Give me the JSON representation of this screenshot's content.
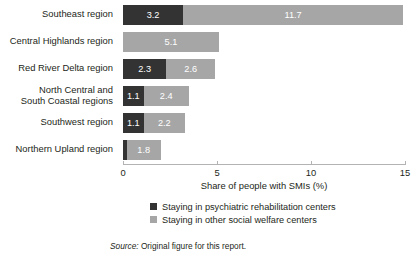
{
  "chart_data": {
    "type": "bar",
    "orientation": "horizontal",
    "stacked": true,
    "title": "",
    "xlabel": "Share of people with SMIs (%)",
    "ylabel": "",
    "xlim": [
      0,
      15
    ],
    "xticks": [
      0,
      5,
      10,
      15
    ],
    "xtick_labels": [
      "0",
      "5",
      "10",
      "15"
    ],
    "grid": false,
    "legend_position": "bottom",
    "categories": [
      "Southeast region",
      "Central Highlands region",
      "Red River Delta region",
      "North Central and\nSouth Coastal regions",
      "Southwest region",
      "Northern Upland region"
    ],
    "series": [
      {
        "name": "Staying in psychiatric rehabilitation centers",
        "color": "#333333",
        "values": [
          3.2,
          0,
          2.3,
          1.1,
          1.1,
          0.2
        ],
        "labels": [
          "3.2",
          "",
          "2.3",
          "1.1",
          "1.1",
          ""
        ]
      },
      {
        "name": "Staying in other social welfare centers",
        "color": "#a6a6a6",
        "values": [
          11.7,
          5.1,
          2.6,
          2.4,
          2.2,
          1.8
        ],
        "labels": [
          "11.7",
          "5.1",
          "2.6",
          "2.4",
          "2.2",
          "1.8"
        ]
      }
    ]
  },
  "axis": {
    "title": "Share of people with SMIs (%)",
    "ticks": [
      "0",
      "5",
      "10",
      "15"
    ]
  },
  "legend": {
    "items": [
      {
        "label": "Staying in psychiatric rehabilitation centers",
        "color": "#333333"
      },
      {
        "label": "Staying in other social welfare centers",
        "color": "#a6a6a6"
      }
    ]
  },
  "source": {
    "prefix": "Source:",
    "text": " Original figure for this report."
  }
}
